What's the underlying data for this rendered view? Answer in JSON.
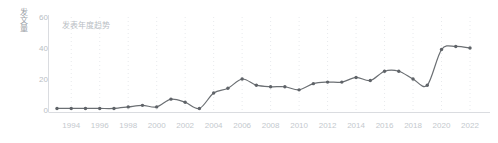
{
  "chart_data": {
    "type": "line",
    "title": "发表年度趋势",
    "xlabel": "",
    "ylabel": "发文量",
    "ylim": [
      0,
      60
    ],
    "yticks": [
      0,
      20,
      40,
      60
    ],
    "xticks": [
      "1994",
      "1996",
      "1998",
      "2000",
      "2002",
      "2004",
      "2006",
      "2008",
      "2010",
      "2012",
      "2014",
      "2016",
      "2018",
      "2020",
      "2022"
    ],
    "xlim": [
      1993,
      2022
    ],
    "grid": "dotted-vertical",
    "legend": "none",
    "line_color": "#6b6f73",
    "marker_color": "#5f6368",
    "categories": [
      1993,
      1994,
      1995,
      1996,
      1997,
      1998,
      1999,
      2000,
      2001,
      2002,
      2003,
      2004,
      2005,
      2006,
      2007,
      2008,
      2009,
      2010,
      2011,
      2012,
      2013,
      2014,
      2015,
      2016,
      2017,
      2018,
      2019,
      2020,
      2021,
      2022
    ],
    "values": [
      1,
      1,
      1,
      1,
      1,
      2,
      3,
      2,
      7,
      5,
      1,
      11,
      14,
      20,
      16,
      15,
      15,
      13,
      17,
      18,
      18,
      21,
      19,
      25,
      25,
      20,
      16,
      39,
      41,
      40
    ],
    "series": [
      {
        "name": "发文量",
        "values": [
          1,
          1,
          1,
          1,
          1,
          2,
          3,
          2,
          7,
          5,
          1,
          11,
          14,
          20,
          16,
          15,
          15,
          13,
          17,
          18,
          18,
          21,
          19,
          25,
          25,
          20,
          16,
          39,
          41,
          40
        ]
      }
    ]
  },
  "colors": {
    "line": "#6b6f73",
    "marker": "#5f6368",
    "tick_text": "#c0c5ca",
    "title_text": "#b9bec4",
    "axis_label": "#9aa0a6",
    "grid": "#e8eaed",
    "axis": "#dadce0"
  }
}
